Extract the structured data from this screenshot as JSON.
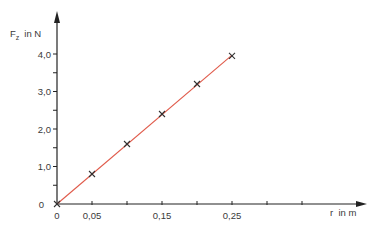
{
  "chart_data": {
    "type": "line",
    "title": "",
    "xlabel": "r  in m",
    "ylabel": "F_z  in N",
    "ylabel_main": "F",
    "ylabel_sub": "z",
    "ylabel_unit": "in N",
    "x_ticks": [
      0,
      0.05,
      0.1,
      0.15,
      0.2,
      0.25,
      0.3,
      0.35
    ],
    "x_tick_labels": [
      "0",
      "0,05",
      "",
      "0,15",
      "",
      "0,25",
      "",
      ""
    ],
    "y_ticks": [
      0,
      0.5,
      1.0,
      1.5,
      2.0,
      2.5,
      3.0,
      3.5,
      4.0
    ],
    "y_tick_labels": [
      "0",
      "",
      "1,0",
      "",
      "2,0",
      "",
      "3,0",
      "",
      "4,0"
    ],
    "xlim": [
      0,
      0.44
    ],
    "ylim": [
      0,
      4.5
    ],
    "grid": false,
    "legend": null,
    "series": [
      {
        "name": "Messwerte",
        "marker": "x",
        "x": [
          0,
          0.05,
          0.1,
          0.15,
          0.2,
          0.25
        ],
        "values": [
          0,
          0.8,
          1.6,
          2.4,
          3.2,
          3.95
        ]
      },
      {
        "name": "Ausgleichsgerade",
        "line_color": "#e05a4a",
        "x": [
          0,
          0.25
        ],
        "values": [
          0,
          3.97
        ]
      }
    ],
    "colors": {
      "axis": "#222222",
      "fit_line": "#e05a4a",
      "marker": "#333333"
    }
  }
}
